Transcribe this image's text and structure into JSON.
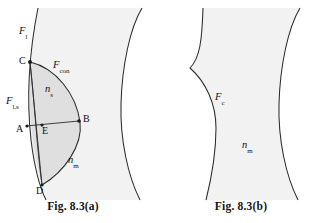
{
  "figure": {
    "title_a": "Fig. 8.3(a)",
    "title_b": "Fig. 8.3(b)",
    "panel_a": {
      "labels": {
        "f_l": "F",
        "f_l_sub": "l",
        "f_con": "F",
        "f_con_sub": "con",
        "f_ls": "F",
        "f_ls_sub": "l,s",
        "n_s": "n",
        "n_s_sub": "s",
        "n_m": "n",
        "n_m_sub": "m"
      },
      "points": [
        "C",
        "B",
        "A",
        "E",
        "D"
      ]
    },
    "panel_b": {
      "labels": {
        "f_c": "F",
        "f_c_sub": "c",
        "n_m": "n",
        "n_m_sub": "m"
      }
    },
    "colors": {
      "background": "#ffffff",
      "medium_fill": "#f2f2f2",
      "lens_fill": "#dcdcdc",
      "stroke": "#2b2b2b",
      "text": "#121212"
    }
  }
}
